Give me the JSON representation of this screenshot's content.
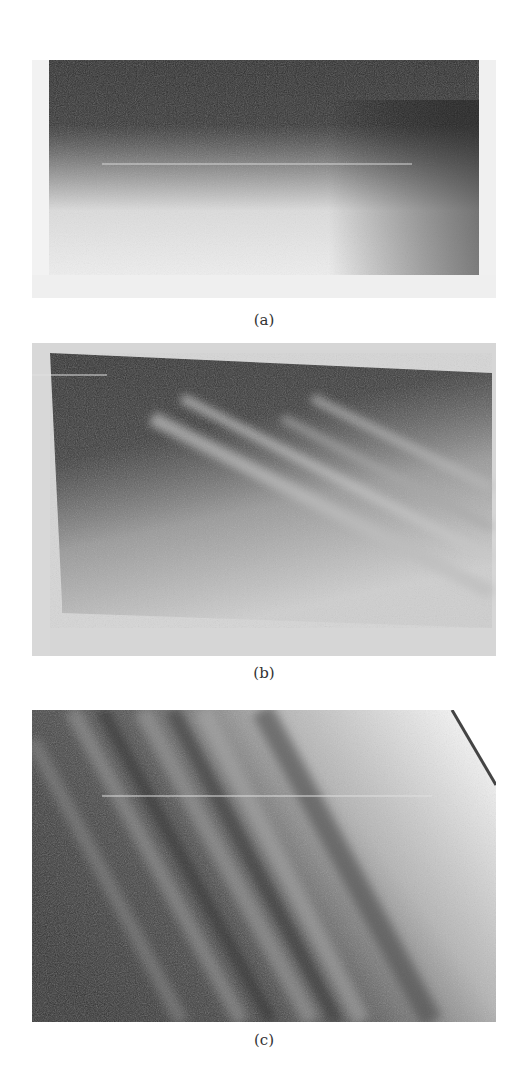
{
  "figure": {
    "panels": [
      {
        "id": "a",
        "label": "(a)",
        "description": "Grayscale photograph: dark upper region fading to light lower region, uniform horizontal gradient"
      },
      {
        "id": "b",
        "label": "(b)",
        "description": "Grayscale photograph: dark trapezoidal region with slanted top edge and several light diagonal streaks descending to the right"
      },
      {
        "id": "c",
        "label": "(c)",
        "description": "Grayscale photograph: alternating dark and light diagonal bands sloping down to the right, lighter toward upper-right corner"
      }
    ]
  }
}
